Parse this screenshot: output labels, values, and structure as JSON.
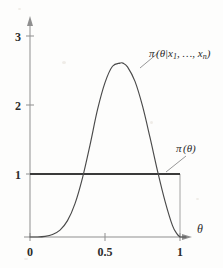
{
  "figure": {
    "name": "prior-posterior-density-figure",
    "background_color": "#fdfdfc",
    "curve_color": "#4a4a4a",
    "prior_color": "#3a3a3a",
    "axis_color": "#8f8f8f"
  },
  "axes": {
    "x": {
      "variable_label": "θ",
      "ticks": [
        {
          "value": 0,
          "label": "0"
        },
        {
          "value": 0.5,
          "label": "0.5"
        },
        {
          "value": 1,
          "label": "1"
        }
      ],
      "range": [
        0,
        1.08
      ]
    },
    "y": {
      "variable_label": "",
      "ticks": [
        {
          "value": 1,
          "label": "1"
        },
        {
          "value": 2,
          "label": "2"
        },
        {
          "value": 3,
          "label": "3"
        }
      ],
      "range": [
        0,
        3.35
      ]
    }
  },
  "labels": {
    "posterior": "π (θ|x₁, …, xₙ)",
    "posterior_pi": "π",
    "posterior_args": "(θ|x",
    "posterior_sub1": "1",
    "posterior_mid": ", …, x",
    "posterior_subn": "n",
    "posterior_close": ")",
    "prior": "π (θ)",
    "prior_pi": "π",
    "prior_args": "(θ)"
  },
  "chart_data": {
    "type": "line",
    "title": "",
    "subtitle": "",
    "xlabel": "θ",
    "ylabel": "",
    "xlim": [
      0,
      1.08
    ],
    "ylim": [
      0,
      3.35
    ],
    "grid": false,
    "legend_position": "inline-annotation",
    "xticks": [
      0,
      0.5,
      1
    ],
    "xticklabels": [
      "0",
      "0.5",
      "1"
    ],
    "yticks": [
      1,
      2,
      3
    ],
    "yticklabels": [
      "1",
      "2",
      "3"
    ],
    "annotations": [
      {
        "text": "π (θ|x₁, …, xₙ)",
        "target_x": 0.7,
        "target_y": 2.45,
        "label_x": 0.79,
        "label_y": 2.78
      },
      {
        "text": "π (θ)",
        "target_x": 0.88,
        "target_y": 1.0,
        "label_x": 0.96,
        "label_y": 1.45
      }
    ],
    "series": [
      {
        "name": "π (θ)",
        "kind": "prior",
        "style": "thick-solid",
        "x": [
          0.0,
          1.0
        ],
        "values": [
          1.0,
          1.0
        ]
      },
      {
        "name": "π (θ|x₁, …, xₙ)",
        "kind": "posterior",
        "style": "thin-solid",
        "peak_x": 0.62,
        "peak_y": 2.76,
        "x": [
          0.0,
          0.05,
          0.1,
          0.15,
          0.2,
          0.25,
          0.3,
          0.35,
          0.4,
          0.45,
          0.5,
          0.55,
          0.6,
          0.62,
          0.65,
          0.7,
          0.75,
          0.8,
          0.85,
          0.9,
          0.95,
          0.98,
          1.0
        ],
        "values": [
          0.0,
          0.0,
          0.01,
          0.04,
          0.11,
          0.26,
          0.53,
          0.94,
          1.46,
          2.02,
          2.45,
          2.71,
          2.76,
          2.76,
          2.7,
          2.47,
          2.08,
          1.58,
          1.05,
          0.57,
          0.18,
          0.05,
          0.0
        ]
      }
    ],
    "droplines": [
      {
        "x": 1.0,
        "from_y": 0.0,
        "to_y": 1.0
      }
    ]
  }
}
